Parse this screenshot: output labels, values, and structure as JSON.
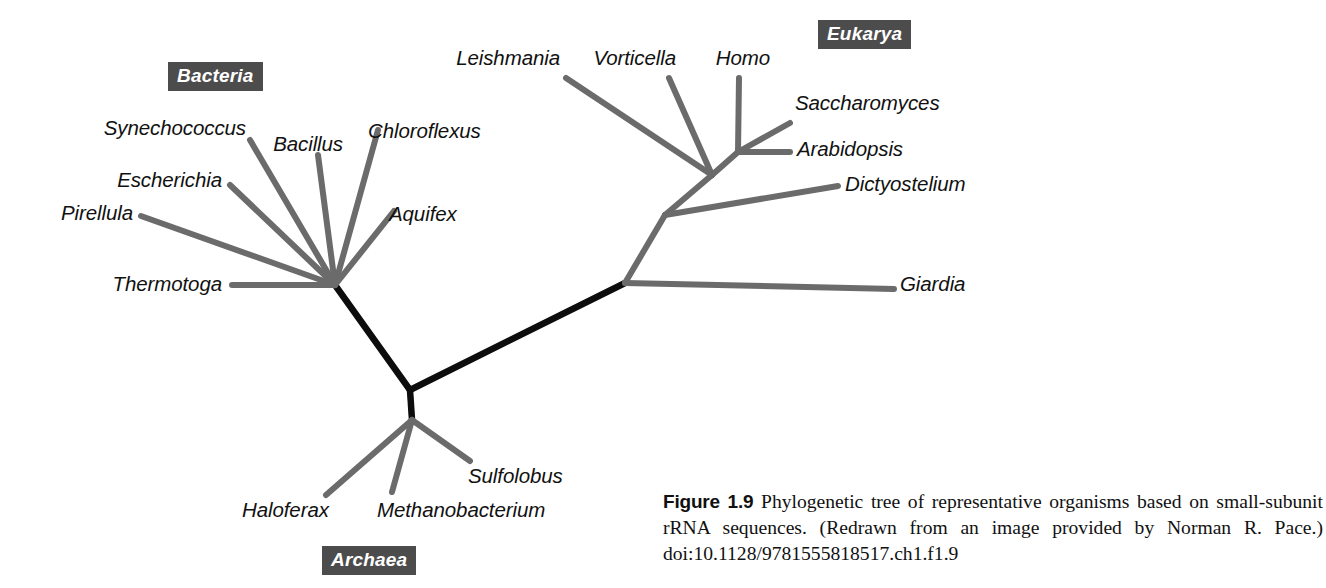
{
  "figure": {
    "number_label": "Figure 1.9",
    "caption_text": "Phylogenetic tree of representative organisms based on small-subunit rRNA sequences. (Redrawn from an image provided by Norman R. Pace.)",
    "doi": "doi:10.1128/9781555818517.ch1.f1.9"
  },
  "domains": {
    "bacteria": {
      "label": "Bacteria",
      "x": 168,
      "y": 62
    },
    "eukarya": {
      "label": "Eukarya",
      "x": 818,
      "y": 20
    },
    "archaea": {
      "label": "Archaea",
      "x": 322,
      "y": 546
    }
  },
  "colors": {
    "branch_gray": "#6b6b6b",
    "branch_black": "#0d0d0d",
    "domain_box_bg": "#4c4c4c",
    "domain_box_text": "#ffffff",
    "label_text": "#111111",
    "background": "#ffffff"
  },
  "chart_data": {
    "type": "phylogenetic-tree",
    "title": "Phylogenetic tree of representative organisms based on small-subunit rRNA sequences",
    "layout": "unrooted-radial",
    "units": "evolutionary distance (unscaled)",
    "root": {
      "name": "universal-root",
      "x": 410,
      "y": 390
    },
    "nodes": [
      {
        "id": "root",
        "x": 410,
        "y": 390,
        "label": ""
      },
      {
        "id": "bacteria-node",
        "x": 335,
        "y": 285,
        "label": ""
      },
      {
        "id": "eukarya-base",
        "x": 625,
        "y": 283,
        "label": ""
      },
      {
        "id": "eukarya-mid",
        "x": 665,
        "y": 215,
        "label": ""
      },
      {
        "id": "eukarya-upper",
        "x": 712,
        "y": 175,
        "label": ""
      },
      {
        "id": "eukarya-crown",
        "x": 738,
        "y": 152,
        "label": ""
      },
      {
        "id": "archaea-node",
        "x": 412,
        "y": 420,
        "label": ""
      }
    ],
    "trunk_branches": [
      {
        "from": "root",
        "to": "bacteria-node",
        "weight": "heavy",
        "color": "#0d0d0d"
      },
      {
        "from": "root",
        "to": "eukarya-base",
        "weight": "heavy",
        "color": "#0d0d0d"
      },
      {
        "from": "root",
        "to": "archaea-node",
        "weight": "heavy",
        "color": "#0d0d0d"
      }
    ],
    "domain_groups": [
      "Bacteria",
      "Archaea",
      "Eukarya"
    ],
    "taxa": [
      {
        "name": "Thermotoga",
        "domain": "Bacteria",
        "parent": "bacteria-node",
        "tip_x": 232,
        "tip_y": 285,
        "label_x": 222,
        "label_y": 274,
        "align": "end"
      },
      {
        "name": "Pirellula",
        "domain": "Bacteria",
        "parent": "bacteria-node",
        "tip_x": 141,
        "tip_y": 216,
        "label_x": 133,
        "label_y": 203,
        "align": "end"
      },
      {
        "name": "Escherichia",
        "domain": "Bacteria",
        "parent": "bacteria-node",
        "tip_x": 230,
        "tip_y": 185,
        "label_x": 222,
        "label_y": 170,
        "align": "end"
      },
      {
        "name": "Synechococcus",
        "domain": "Bacteria",
        "parent": "bacteria-node",
        "tip_x": 250,
        "tip_y": 140,
        "label_x": 246,
        "label_y": 118,
        "align": "end"
      },
      {
        "name": "Bacillus",
        "domain": "Bacteria",
        "parent": "bacteria-node",
        "tip_x": 318,
        "tip_y": 155,
        "label_x": 343,
        "label_y": 134,
        "align": "end"
      },
      {
        "name": "Chloroflexus",
        "domain": "Bacteria",
        "parent": "bacteria-node",
        "tip_x": 378,
        "tip_y": 130,
        "label_x": 368,
        "label_y": 121,
        "align": "start"
      },
      {
        "name": "Aquifex",
        "domain": "Bacteria",
        "parent": "bacteria-node",
        "tip_x": 394,
        "tip_y": 211,
        "label_x": 389,
        "label_y": 204,
        "align": "start"
      },
      {
        "name": "Haloferax",
        "domain": "Archaea",
        "parent": "archaea-node",
        "tip_x": 326,
        "tip_y": 495,
        "label_x": 242,
        "label_y": 500,
        "align": "start"
      },
      {
        "name": "Methanobacterium",
        "domain": "Archaea",
        "parent": "archaea-node",
        "tip_x": 392,
        "tip_y": 492,
        "label_x": 377,
        "label_y": 500,
        "align": "start"
      },
      {
        "name": "Sulfolobus",
        "domain": "Archaea",
        "parent": "archaea-node",
        "tip_x": 470,
        "tip_y": 461,
        "label_x": 468,
        "label_y": 466,
        "align": "start"
      },
      {
        "name": "Giardia",
        "domain": "Eukarya",
        "parent": "eukarya-base",
        "tip_x": 894,
        "tip_y": 289,
        "label_x": 900,
        "label_y": 274,
        "align": "start"
      },
      {
        "name": "Dictyostelium",
        "domain": "Eukarya",
        "parent": "eukarya-mid",
        "tip_x": 838,
        "tip_y": 186,
        "label_x": 845,
        "label_y": 174,
        "align": "start"
      },
      {
        "name": "Leishmania",
        "domain": "Eukarya",
        "parent": "eukarya-upper",
        "tip_x": 566,
        "tip_y": 78,
        "label_x": 560,
        "label_y": 48,
        "align": "end"
      },
      {
        "name": "Vorticella",
        "domain": "Eukarya",
        "parent": "eukarya-upper",
        "tip_x": 669,
        "tip_y": 78,
        "label_x": 676,
        "label_y": 48,
        "align": "end"
      },
      {
        "name": "Homo",
        "domain": "Eukarya",
        "parent": "eukarya-crown",
        "tip_x": 739,
        "tip_y": 78,
        "label_x": 770,
        "label_y": 48,
        "align": "end"
      },
      {
        "name": "Saccharomyces",
        "domain": "Eukarya",
        "parent": "eukarya-crown",
        "tip_x": 790,
        "tip_y": 123,
        "label_x": 795,
        "label_y": 93,
        "align": "start"
      },
      {
        "name": "Arabidopsis",
        "domain": "Eukarya",
        "parent": "eukarya-crown",
        "tip_x": 790,
        "tip_y": 152,
        "label_x": 797,
        "label_y": 139,
        "align": "start"
      }
    ]
  }
}
